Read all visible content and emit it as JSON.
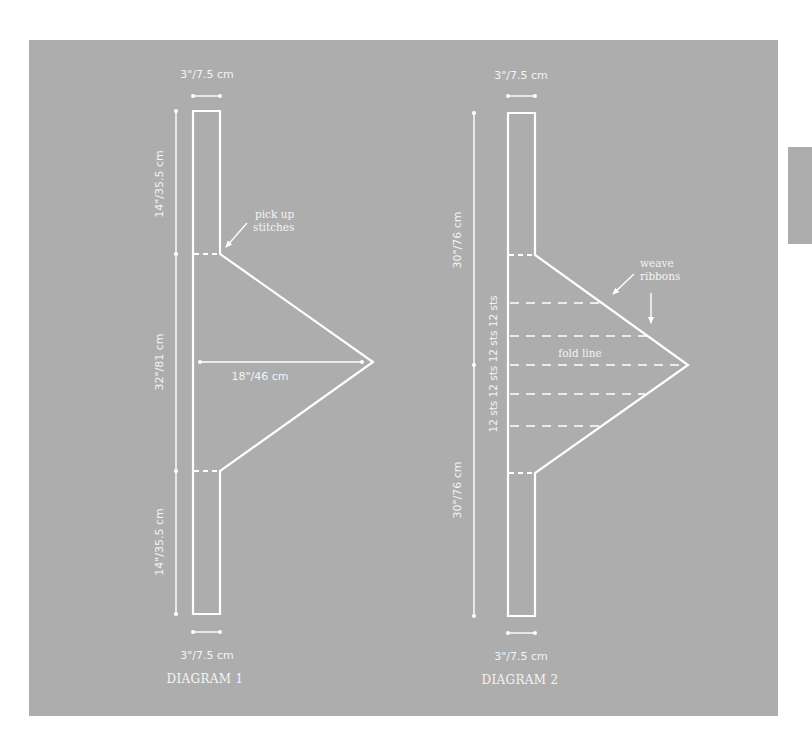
{
  "diagram1": {
    "title": "DIAGRAM 1",
    "top_width": "3\"/7.5 cm",
    "bottom_width": "3\"/7.5 cm",
    "top_length": "14\"/35.5 cm",
    "middle_length": "32\"/81 cm",
    "bottom_length": "14\"/35.5 cm",
    "triangle_depth": "18\"/46 cm",
    "callout_line1": "pick up",
    "callout_line2": "stitches"
  },
  "diagram2": {
    "title": "DIAGRAM 2",
    "top_width": "3\"/7.5 cm",
    "bottom_width": "3\"/7.5 cm",
    "top_length": "30\"/76 cm",
    "bottom_length": "30\"/76 cm",
    "stitch_sections": "12 sts  12 sts 12 sts  12 sts",
    "fold_label": "fold line",
    "callout_line1": "weave",
    "callout_line2": "ribbons"
  },
  "colors": {
    "panel": "#adadad",
    "lines": "#ffffff",
    "page": "#ffffff"
  }
}
